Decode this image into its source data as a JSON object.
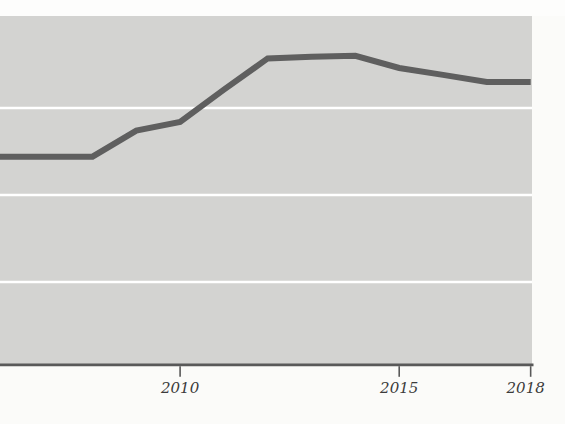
{
  "figure": {
    "x_axis_tick_labels": [
      "2010",
      "2015",
      "2018"
    ]
  },
  "chart_data": {
    "type": "line",
    "title": "",
    "xlabel": "",
    "ylabel": "",
    "x": [
      2006,
      2007,
      2008,
      2009,
      2010,
      2011,
      2012,
      2013,
      2014,
      2015,
      2016,
      2017,
      2018
    ],
    "values": [
      2.44,
      2.44,
      2.44,
      2.74,
      2.84,
      3.21,
      3.57,
      3.59,
      3.6,
      3.46,
      3.38,
      3.3,
      3.3
    ],
    "x_tick_labels": [
      "2010",
      "2015",
      "2018"
    ],
    "x_tick_years": [
      2010,
      2015,
      2018
    ],
    "x_tick_label_dx": [
      0,
      0,
      -5
    ],
    "xlim": [
      2005.8,
      2018.03
    ],
    "ylim": [
      0,
      4.0
    ],
    "gridline_values": [
      1,
      2,
      3
    ],
    "grid": "horizontal-white-lines",
    "legend": "none",
    "lead_in_point": {
      "x": 2005.72,
      "value": 2.44
    },
    "colors": {
      "paper": "#fbfbf9",
      "top_margin": "#fdfdfc",
      "plot_background": "#d3d3d1",
      "gridline": "#ffffff",
      "line": "#5f5f5f",
      "axis": "#595959",
      "tick_label": "#3b3b3b"
    },
    "geometry_px": {
      "width": 565,
      "height": 424,
      "plot": {
        "x": 0,
        "y": 16,
        "w": 532,
        "h": 348
      },
      "axis_y": 364.8,
      "tick_length": 12,
      "label_baseline_y": 393,
      "x_px_per_year": 43.82,
      "x_origin_year": 2005.89,
      "value_y0": 369,
      "px_per_value_unit": 87,
      "line_width": 6,
      "gridline_width": 2.6,
      "axis_width": 2.8,
      "tick_width": 1.6
    }
  }
}
